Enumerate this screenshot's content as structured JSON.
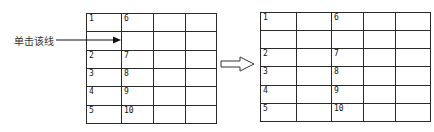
{
  "annotation": {
    "label": "单击该线"
  },
  "left_table": {
    "columns": 4,
    "rows": [
      [
        "1",
        "6",
        "",
        ""
      ],
      [
        "",
        "",
        "",
        ""
      ],
      [
        "2",
        "7",
        "",
        ""
      ],
      [
        "3",
        "8",
        "",
        ""
      ],
      [
        "4",
        "9",
        "",
        ""
      ],
      [
        "5",
        "10",
        "",
        ""
      ]
    ]
  },
  "right_table": {
    "columns": 5,
    "rows": [
      [
        "1",
        "",
        "6",
        "",
        ""
      ],
      [
        "",
        "",
        "",
        "",
        ""
      ],
      [
        "2",
        "",
        "7",
        "",
        ""
      ],
      [
        "3",
        "",
        "8",
        "",
        ""
      ],
      [
        "4",
        "",
        "9",
        "",
        ""
      ],
      [
        "5",
        "",
        "10",
        "",
        ""
      ]
    ]
  }
}
